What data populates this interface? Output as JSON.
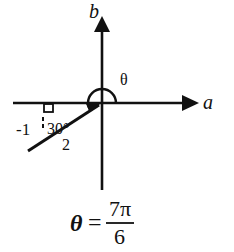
{
  "figure": {
    "axes": {
      "horizontal_label": "a",
      "vertical_label": "b"
    },
    "angle_label": "θ",
    "reference_angle_label": "30°",
    "x_coordinate_label": "-1",
    "hypotenuse_label": "2",
    "formula": {
      "lhs": "θ",
      "equals": "=",
      "numerator": "7π",
      "denominator": "6"
    },
    "colors": {
      "ink": "#111111",
      "background": "#ffffff"
    }
  }
}
